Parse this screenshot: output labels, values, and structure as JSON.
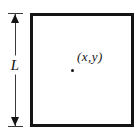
{
  "figure": {
    "side_length_label": "L",
    "point_label": "(x,y)",
    "colors": {
      "ink": "#141414",
      "line": "#3a3a3a",
      "background": "#ffffff"
    }
  }
}
